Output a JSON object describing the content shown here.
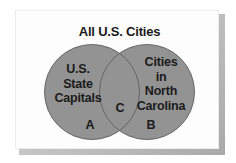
{
  "diagram": {
    "type": "venn",
    "universe_label": "All U.S. Cities",
    "sets": [
      {
        "id": "left",
        "label_lines": [
          "U.S.",
          "State",
          "Capitals"
        ],
        "region_letter": "A"
      },
      {
        "id": "right",
        "label_lines": [
          "Cities",
          "in",
          "North",
          "Carolina"
        ],
        "region_letter": "B"
      }
    ],
    "intersection": {
      "region_letter": "C"
    },
    "colors": {
      "circle_fill": "#939393",
      "circle_stroke": "#5e5e5e",
      "frame_bg": "#fdfdfd",
      "text": "#1a1a1a"
    }
  }
}
